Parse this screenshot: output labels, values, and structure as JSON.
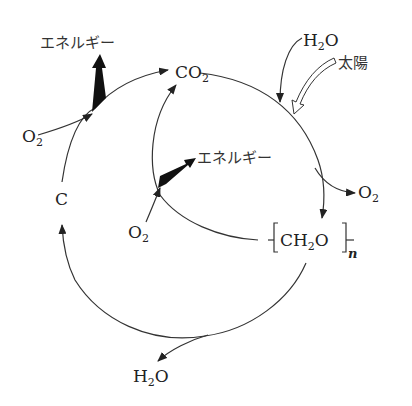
{
  "diagram": {
    "type": "carbon-cycle",
    "labels": {
      "energy_top": "エネルギー",
      "energy_inner": "エネルギー",
      "co2": "CO",
      "co2_sub": "2",
      "h2o_top": "H",
      "h2o_top_sub": "2",
      "h2o_top_o": "O",
      "sun": "太陽",
      "o2_left": "O",
      "o2_left_sub": "2",
      "o2_right": "O",
      "o2_right_sub": "2",
      "o2_inner": "O",
      "o2_inner_sub": "2",
      "carbon": "C",
      "ch2o_c": "CH",
      "ch2o_sub": "2",
      "ch2o_o": "O",
      "ch2o_n": "n",
      "h2o_bottom": "H",
      "h2o_bottom_sub": "2",
      "h2o_bottom_o": "O"
    },
    "colors": {
      "stroke": "#333333",
      "fill_arrow": "#111111",
      "background": "#ffffff"
    }
  }
}
